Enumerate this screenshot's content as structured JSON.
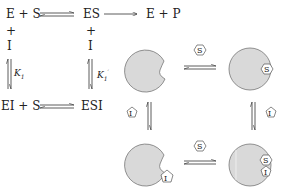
{
  "scheme": {
    "top_left": "E + S",
    "top_mid": "ES",
    "top_right": "E + P",
    "plus_left": "+",
    "plus_mid": "+",
    "inhibitor_left": "I",
    "inhibitor_mid": "I",
    "k_left": "K",
    "k_left_sub": "1",
    "k_right": "K",
    "k_right_sub": "1",
    "k_right_sup": "′",
    "bottom_left": "EI + S",
    "bottom_right": "ESI"
  },
  "cartoon": {
    "substrate_label": "S",
    "inhibitor_label": "I",
    "enzyme_fill": "#d9d9d9",
    "enzyme_stroke": "#777777",
    "ligand_fill": "#ffffff"
  }
}
